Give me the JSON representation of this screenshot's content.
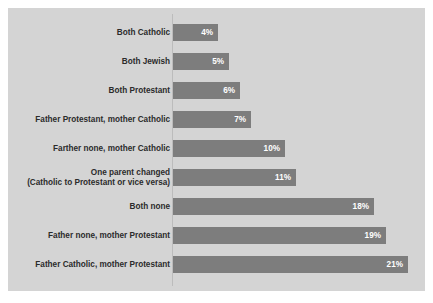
{
  "chart_data": {
    "type": "bar",
    "orientation": "horizontal",
    "title": "",
    "subtitle": "",
    "xlabel": "",
    "ylabel": "",
    "grid": false,
    "legend": "none",
    "xlim": [
      0,
      21
    ],
    "value_suffix": "%",
    "colors": {
      "bar_fill": "#7d7d7d",
      "panel_background": "#d4d4d4",
      "page_background": "#ffffff",
      "label_text": "#2b2b2b",
      "value_text": "#ffffff",
      "axis_line": "#bcbcbc"
    },
    "categories": [
      "Both Catholic",
      "Both Jewish",
      "Both Protestant",
      "Father Protestant, mother Catholic",
      "Farther none, mother Catholic",
      "One parent changed (Catholic to Protestant or vice versa)",
      "Both none",
      "Father none, mother Protestant",
      "Father Catholic, mother Protestant"
    ],
    "values": [
      4,
      5,
      6,
      7,
      10,
      11,
      18,
      19,
      21
    ],
    "value_labels": [
      "4%",
      "5%",
      "6%",
      "7%",
      "10%",
      "11%",
      "18%",
      "19%",
      "21%"
    ]
  },
  "bars": [
    {
      "label_line1": "Both Catholic",
      "label_line2": "",
      "value": 4,
      "value_label": "4%"
    },
    {
      "label_line1": "Both Jewish",
      "label_line2": "",
      "value": 5,
      "value_label": "5%"
    },
    {
      "label_line1": "Both Protestant",
      "label_line2": "",
      "value": 6,
      "value_label": "6%"
    },
    {
      "label_line1": "Father Protestant, mother Catholic",
      "label_line2": "",
      "value": 7,
      "value_label": "7%"
    },
    {
      "label_line1": "Farther none, mother Catholic",
      "label_line2": "",
      "value": 10,
      "value_label": "10%"
    },
    {
      "label_line1": "One parent changed",
      "label_line2": "(Catholic to Protestant or vice versa)",
      "value": 11,
      "value_label": "11%"
    },
    {
      "label_line1": "Both none",
      "label_line2": "",
      "value": 18,
      "value_label": "18%"
    },
    {
      "label_line1": "Father none, mother Protestant",
      "label_line2": "",
      "value": 19,
      "value_label": "19%"
    },
    {
      "label_line1": "Father Catholic, mother Protestant",
      "label_line2": "",
      "value": 21,
      "value_label": "21%"
    }
  ]
}
